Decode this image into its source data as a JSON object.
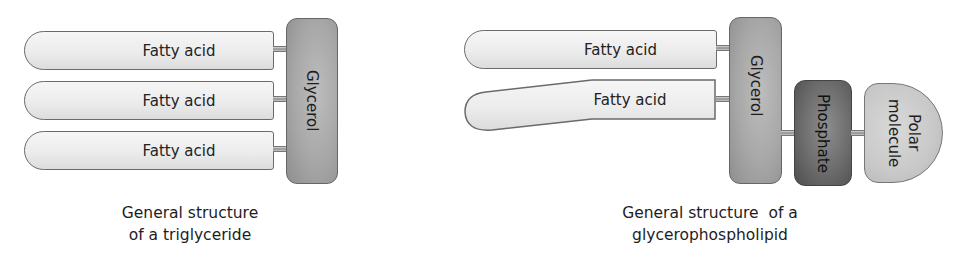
{
  "triglyceride": {
    "fatty_acids": [
      "Fatty acid",
      "Fatty acid",
      "Fatty acid"
    ],
    "backbone": "Glycerol",
    "caption_line1": "General structure",
    "caption_line2": "of a triglyceride"
  },
  "glycerophospholipid": {
    "fatty_acids": [
      "Fatty acid",
      "Fatty acid"
    ],
    "backbone": "Glycerol",
    "phosphate": "Phosphate",
    "polar_line1": "Polar",
    "polar_line2": "molecule",
    "caption_line1": "General structure  of a",
    "caption_line2": "glycerophospholipid"
  },
  "colors": {
    "fatty_acid_fill": "#ececec",
    "glycerol_fill": "#a7a7a7",
    "phosphate_fill": "#6c6c6c",
    "polar_fill": "#c8c8c8",
    "outline": "#666666"
  }
}
